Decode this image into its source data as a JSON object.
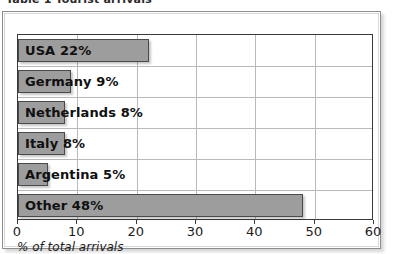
{
  "caption": {
    "text": "Table 1  Tourist arrivals"
  },
  "chart_data": {
    "type": "bar",
    "orientation": "horizontal",
    "title": "",
    "subtitle": "",
    "xlabel": "% of total arrivals",
    "ylabel": "",
    "xlim": [
      0,
      60
    ],
    "xticks": [
      0,
      10,
      20,
      30,
      40,
      50,
      60
    ],
    "xtick_labels": [
      "0",
      "10",
      "20",
      "30",
      "40",
      "50",
      "60"
    ],
    "grid": true,
    "grid_axes": "both",
    "legend": false,
    "legend_position": "none",
    "categories": [
      "USA",
      "Germany",
      "Netherlands",
      "Italy",
      "Argentina",
      "Other"
    ],
    "values": [
      22,
      9,
      8,
      8,
      5,
      48
    ],
    "bar_labels": [
      "USA 22%",
      "Germany 9%",
      "Netherlands 8%",
      "Italy 8%",
      "Argentina 5%",
      "Other 48%"
    ],
    "bar_color": "#9d9d9d",
    "bar_border_color": "#4a4a4a",
    "plot_border_color": "#3a3a3a",
    "grid_color": "#b9b9b9",
    "background_color": "#ffffff",
    "text_color": "#101010"
  }
}
